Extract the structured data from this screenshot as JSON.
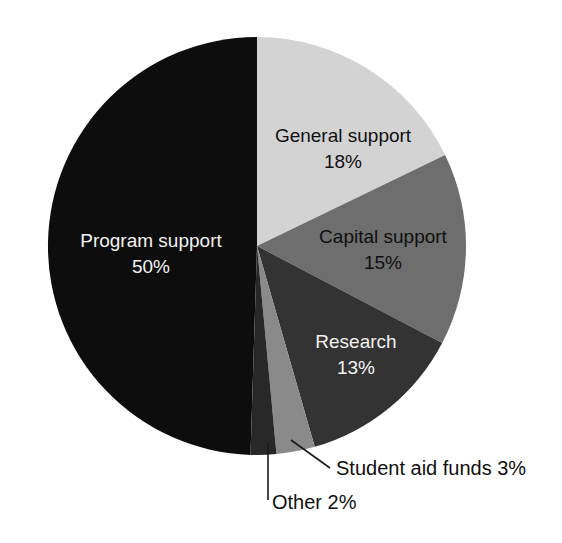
{
  "chart_data": {
    "type": "pie",
    "title": "",
    "xlabel": "",
    "ylabel": "",
    "legend_position": "none",
    "grid": false,
    "units": "percent",
    "start_angle_deg": 0,
    "direction": "clockwise",
    "categories": [
      "General support",
      "Capital support",
      "Research",
      "Student aid funds",
      "Other",
      "Program support"
    ],
    "values": [
      18,
      15,
      13,
      3,
      2,
      50
    ],
    "labels": [
      "General support 18%",
      "Capital support 15%",
      "Research 13%",
      "Student aid funds 3%",
      "Other 2%",
      "Program support 50%"
    ],
    "colors": [
      "#d3d3d3",
      "#6e6e6e",
      "#333333",
      "#8a8a8a",
      "#282828",
      "#0d0d0d"
    ],
    "slices": [
      {
        "name": "General support",
        "value": 18,
        "value_label": "18%",
        "color": "#d3d3d3",
        "label_placement": "inside",
        "text_color": "dark"
      },
      {
        "name": "Capital support",
        "value": 15,
        "value_label": "15%",
        "color": "#6e6e6e",
        "label_placement": "inside",
        "text_color": "dark"
      },
      {
        "name": "Research",
        "value": 13,
        "value_label": "13%",
        "color": "#333333",
        "label_placement": "inside",
        "text_color": "light"
      },
      {
        "name": "Student aid funds",
        "value": 3,
        "value_label": "3%",
        "color": "#8a8a8a",
        "label_placement": "outside",
        "text_color": "dark",
        "callout_text": "Student aid funds 3%"
      },
      {
        "name": "Other",
        "value": 2,
        "value_label": "2%",
        "color": "#282828",
        "label_placement": "outside",
        "text_color": "dark",
        "callout_text": "Other 2%"
      },
      {
        "name": "Program support",
        "value": 50,
        "value_label": "50%",
        "color": "#0d0d0d",
        "label_placement": "inside",
        "text_color": "light"
      }
    ]
  },
  "labels": {
    "general_name": "General support",
    "general_pct": "18%",
    "capital_name": "Capital support",
    "capital_pct": "15%",
    "research_name": "Research",
    "research_pct": "13%",
    "program_name": "Program support",
    "program_pct": "50%",
    "student_callout": "Student aid funds 3%",
    "other_callout": "Other 2%"
  },
  "geometry": {
    "center_x": 257,
    "center_y": 246,
    "radius": 209
  }
}
